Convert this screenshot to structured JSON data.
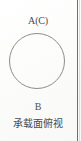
{
  "figure": {
    "kind": "engineering-drawing-top-view",
    "datum_top_label": "A(C)",
    "datum_bottom_label": "B",
    "caption": "承载面俯视",
    "shape": {
      "name": "circle-outline",
      "center_x": 37,
      "center_y": 61,
      "diameter": 56
    },
    "colors": {
      "background": "#fdfdfc",
      "outline": "#8d8d8d",
      "text": "#4a4a4a",
      "border_rule": "#6f6f6f"
    }
  }
}
